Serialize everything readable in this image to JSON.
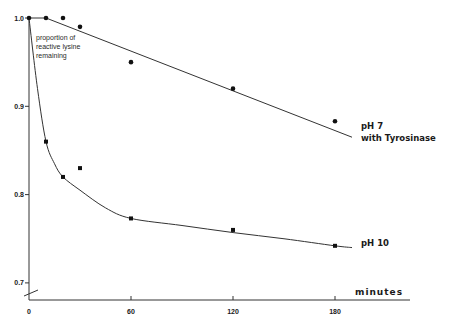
{
  "chart_data": {
    "type": "line",
    "title": "",
    "xlabel": "minutes",
    "ylabel": "",
    "annotation": [
      "proportion of",
      "reactive lysine",
      "remaining"
    ],
    "xlim": [
      0,
      210
    ],
    "ylim": [
      0.68,
      1.0
    ],
    "x_ticks": [
      0,
      60,
      120,
      180
    ],
    "x_tick_labels": [
      "0",
      "60",
      "120",
      "180"
    ],
    "y_ticks": [
      0.7,
      0.8,
      0.9,
      1.0
    ],
    "y_tick_labels": [
      "0.7",
      "0.8",
      "0.9",
      "1.0"
    ],
    "grid": false,
    "axis_break": true,
    "series": [
      {
        "name": "pH 7 with Tyrosinase",
        "label_lines": [
          "pH  7",
          "with   Tyrosinase"
        ],
        "marker": "circle",
        "x": [
          0,
          10,
          20,
          30,
          60,
          120,
          180
        ],
        "y": [
          1.0,
          1.0,
          1.0,
          0.99,
          0.95,
          0.92,
          0.883
        ],
        "fit_line": [
          [
            0,
            1.0
          ],
          [
            10,
            1.0
          ],
          [
            190,
            0.865
          ]
        ]
      },
      {
        "name": "pH 10",
        "label_lines": [
          "pH  10"
        ],
        "marker": "square",
        "x": [
          0,
          10,
          20,
          30,
          60,
          120,
          180
        ],
        "y": [
          1.0,
          0.86,
          0.82,
          0.83,
          0.773,
          0.76,
          0.742
        ],
        "fit_curve": [
          [
            0,
            1.0
          ],
          [
            5,
            0.92
          ],
          [
            10,
            0.86
          ],
          [
            15,
            0.835
          ],
          [
            20,
            0.82
          ],
          [
            30,
            0.805
          ],
          [
            45,
            0.785
          ],
          [
            60,
            0.773
          ],
          [
            90,
            0.765
          ],
          [
            120,
            0.757
          ],
          [
            150,
            0.75
          ],
          [
            180,
            0.742
          ],
          [
            190,
            0.74
          ]
        ]
      }
    ]
  }
}
